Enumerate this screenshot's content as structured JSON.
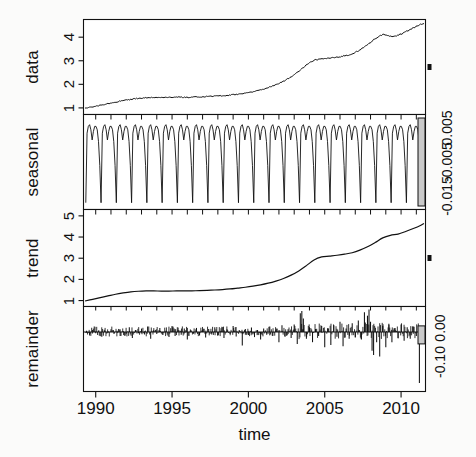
{
  "figure": {
    "type": "stl-decomposition",
    "xlabel": "time",
    "x_ticks": [
      "1990",
      "1995",
      "2000",
      "2005",
      "2010"
    ],
    "x_tick_values": [
      1990,
      1995,
      2000,
      2005,
      2010
    ],
    "xlim": [
      1989.2,
      2011.6
    ],
    "panels": [
      {
        "name": "data",
        "label": "data",
        "y_ticks": [
          "1",
          "2",
          "3",
          "4"
        ],
        "y_tick_values": [
          1,
          2,
          3,
          4
        ],
        "ylim": [
          0.72,
          4.75
        ],
        "scale_bar_label": ""
      },
      {
        "name": "seasonal",
        "label": "seasonal",
        "y_ticks": [],
        "y_tick_values": [],
        "ylim": [
          -0.019,
          0.009
        ],
        "scale_bar_labels": [
          "-0.015",
          "-0.005",
          "0.005"
        ],
        "scale_bar_values": [
          -0.015,
          -0.005,
          0.005
        ]
      },
      {
        "name": "trend",
        "label": "trend",
        "y_ticks": [
          "1",
          "2",
          "3",
          "4",
          "5"
        ],
        "y_tick_values": [
          1,
          2,
          3,
          4,
          5
        ],
        "ylim": [
          0.72,
          5.3
        ],
        "scale_bar_label": ""
      },
      {
        "name": "remainder",
        "label": "remainder",
        "y_ticks": [],
        "y_tick_values": [],
        "ylim": [
          -0.175,
          0.075
        ],
        "scale_bar_labels": [
          "-0.10",
          "0.00"
        ],
        "scale_bar_values": [
          -0.1,
          0.0
        ]
      }
    ]
  },
  "chart_data": {
    "type": "line",
    "title": "",
    "xlabel": "time",
    "ylabel": "",
    "grid": false,
    "legend": "none",
    "xlim": [
      1989.2,
      2011.6
    ],
    "x_ticks": [
      1990,
      1995,
      2000,
      2005,
      2010
    ],
    "series": [
      {
        "name": "data",
        "panel": "data",
        "ylim": [
          0.72,
          4.75
        ],
        "y_ticks": [
          1,
          2,
          3,
          4
        ],
        "x": [
          1989.3,
          1989.6,
          1989.9,
          1990.2,
          1990.5,
          1990.8,
          1991.1,
          1991.4,
          1991.7,
          1992.0,
          1992.3,
          1992.6,
          1992.9,
          1993.2,
          1993.5,
          1993.8,
          1994.1,
          1994.4,
          1994.7,
          1995.0,
          1995.3,
          1995.6,
          1995.9,
          1996.2,
          1996.5,
          1996.8,
          1997.1,
          1997.4,
          1997.7,
          1998.0,
          1998.3,
          1998.6,
          1998.9,
          1999.2,
          1999.5,
          1999.8,
          2000.1,
          2000.4,
          2000.7,
          2001.0,
          2001.3,
          2001.6,
          2001.9,
          2002.2,
          2002.5,
          2002.8,
          2003.1,
          2003.4,
          2003.7,
          2004.0,
          2004.3,
          2004.6,
          2004.9,
          2005.2,
          2005.5,
          2005.8,
          2006.1,
          2006.4,
          2006.7,
          2007.0,
          2007.3,
          2007.6,
          2007.9,
          2008.2,
          2008.5,
          2008.8,
          2009.1,
          2009.4,
          2009.7,
          2010.0,
          2010.3,
          2010.6,
          2010.9,
          2011.2,
          2011.5
        ],
        "y": [
          0.98,
          1.02,
          1.06,
          1.1,
          1.14,
          1.18,
          1.22,
          1.26,
          1.3,
          1.33,
          1.36,
          1.39,
          1.41,
          1.43,
          1.44,
          1.45,
          1.45,
          1.44,
          1.44,
          1.45,
          1.46,
          1.46,
          1.45,
          1.45,
          1.46,
          1.47,
          1.48,
          1.49,
          1.5,
          1.51,
          1.52,
          1.53,
          1.55,
          1.57,
          1.59,
          1.62,
          1.66,
          1.7,
          1.75,
          1.8,
          1.86,
          1.93,
          2.01,
          2.1,
          2.2,
          2.32,
          2.45,
          2.6,
          2.76,
          2.92,
          3.02,
          3.06,
          3.08,
          3.1,
          3.12,
          3.15,
          3.18,
          3.22,
          3.28,
          3.36,
          3.46,
          3.58,
          3.72,
          3.88,
          4.02,
          4.12,
          4.08,
          4.02,
          4.06,
          4.14,
          4.22,
          4.32,
          4.42,
          4.52,
          4.58
        ]
      },
      {
        "name": "seasonal",
        "panel": "seasonal",
        "ylim": [
          -0.019,
          0.009
        ],
        "cycles": 22,
        "period_years": 1,
        "description": "annual sawtooth: broad high plateau with a small M-shaped notch, then a sharp narrow trough",
        "amplitude_high": 0.006,
        "amplitude_low": -0.017,
        "cycle_shape_y": [
          -0.017,
          0.0035,
          0.0055,
          0.006,
          0.0045,
          0.0015,
          0.004,
          0.0055,
          0.0055,
          0.0045,
          0.001,
          -0.006,
          -0.017
        ]
      },
      {
        "name": "trend",
        "panel": "trend",
        "ylim": [
          0.72,
          5.3
        ],
        "y_ticks": [
          1,
          2,
          3,
          4,
          5
        ],
        "x": [
          1989.3,
          1989.8,
          1990.3,
          1990.8,
          1991.3,
          1991.8,
          1992.3,
          1992.8,
          1993.3,
          1993.8,
          1994.3,
          1994.8,
          1995.3,
          1995.8,
          1996.3,
          1996.8,
          1997.3,
          1997.8,
          1998.3,
          1998.8,
          1999.3,
          1999.8,
          2000.3,
          2000.8,
          2001.3,
          2001.8,
          2002.3,
          2002.8,
          2003.3,
          2003.8,
          2004.3,
          2004.8,
          2005.3,
          2005.8,
          2006.3,
          2006.8,
          2007.3,
          2007.8,
          2008.3,
          2008.8,
          2009.3,
          2009.8,
          2010.3,
          2010.8,
          2011.3,
          2011.5
        ],
        "y": [
          0.98,
          1.06,
          1.14,
          1.22,
          1.3,
          1.36,
          1.41,
          1.44,
          1.455,
          1.455,
          1.45,
          1.45,
          1.455,
          1.455,
          1.46,
          1.47,
          1.485,
          1.5,
          1.52,
          1.55,
          1.59,
          1.63,
          1.68,
          1.74,
          1.82,
          1.92,
          2.04,
          2.2,
          2.4,
          2.65,
          2.92,
          3.06,
          3.1,
          3.14,
          3.19,
          3.26,
          3.38,
          3.54,
          3.74,
          3.96,
          4.08,
          4.14,
          4.26,
          4.4,
          4.56,
          4.64
        ]
      },
      {
        "name": "remainder",
        "panel": "remainder",
        "type": "bar",
        "ylim": [
          -0.175,
          0.075
        ],
        "baseline": 0.0,
        "description": "high-frequency residual spikes around zero; largest positive spikes near 2003.5 and 2008, largest negative excursions near 2008-2009 and a deep spike at 2011",
        "x": [
          1989.4,
          1989.6,
          1989.8,
          1990.0,
          1990.2,
          1990.4,
          1990.6,
          1990.8,
          1991.0,
          1991.2,
          1991.4,
          1991.6,
          1991.8,
          1992.0,
          1992.2,
          1992.4,
          1992.6,
          1992.8,
          1993.0,
          1993.2,
          1993.4,
          1993.6,
          1993.8,
          1994.0,
          1994.2,
          1994.4,
          1994.6,
          1994.8,
          1995.0,
          1995.2,
          1995.4,
          1995.6,
          1995.8,
          1996.0,
          1996.2,
          1996.4,
          1996.6,
          1996.8,
          1997.0,
          1997.2,
          1997.4,
          1997.6,
          1997.8,
          1998.0,
          1998.2,
          1998.4,
          1998.6,
          1998.8,
          1999.0,
          1999.2,
          1999.4,
          1999.6,
          1999.8,
          2000.0,
          2000.2,
          2000.4,
          2000.6,
          2000.8,
          2001.0,
          2001.2,
          2001.4,
          2001.6,
          2001.8,
          2002.0,
          2002.2,
          2002.4,
          2002.6,
          2002.8,
          2003.0,
          2003.2,
          2003.4,
          2003.5,
          2003.6,
          2003.8,
          2004.0,
          2004.2,
          2004.4,
          2004.6,
          2004.8,
          2005.0,
          2005.2,
          2005.4,
          2005.6,
          2005.8,
          2006.0,
          2006.2,
          2006.4,
          2006.6,
          2006.8,
          2007.0,
          2007.2,
          2007.4,
          2007.6,
          2007.8,
          2007.9,
          2008.0,
          2008.1,
          2008.2,
          2008.4,
          2008.6,
          2008.8,
          2009.0,
          2009.2,
          2009.4,
          2009.6,
          2009.8,
          2010.0,
          2010.2,
          2010.4,
          2010.6,
          2010.8,
          2011.0,
          2011.2,
          2011.4
        ],
        "y": [
          0.004,
          -0.01,
          0.006,
          -0.004,
          0.005,
          -0.014,
          0.004,
          -0.003,
          0.008,
          -0.006,
          0.004,
          -0.012,
          0.003,
          -0.005,
          0.014,
          -0.018,
          0.006,
          -0.004,
          0.01,
          -0.007,
          0.016,
          -0.02,
          0.005,
          -0.006,
          0.012,
          -0.009,
          0.004,
          -0.015,
          0.018,
          -0.012,
          0.006,
          -0.008,
          0.01,
          -0.022,
          0.007,
          -0.005,
          0.012,
          -0.01,
          0.005,
          -0.016,
          0.009,
          -0.007,
          0.014,
          -0.011,
          0.004,
          -0.018,
          0.008,
          -0.006,
          0.018,
          -0.013,
          0.006,
          -0.04,
          0.009,
          -0.009,
          0.013,
          -0.015,
          0.006,
          -0.022,
          0.01,
          -0.008,
          0.016,
          -0.012,
          0.005,
          -0.03,
          0.02,
          -0.014,
          0.008,
          -0.018,
          0.022,
          -0.035,
          0.055,
          0.062,
          0.04,
          -0.02,
          0.014,
          -0.03,
          0.009,
          -0.012,
          0.018,
          -0.045,
          0.012,
          -0.038,
          0.02,
          -0.014,
          0.03,
          -0.042,
          0.01,
          -0.02,
          0.026,
          -0.016,
          0.034,
          -0.022,
          0.058,
          0.048,
          0.066,
          0.03,
          -0.055,
          -0.068,
          -0.03,
          -0.072,
          0.018,
          -0.045,
          0.024,
          -0.03,
          0.012,
          -0.018,
          0.022,
          -0.026,
          0.014,
          -0.02,
          0.016,
          -0.012,
          -0.15,
          0.01
        ]
      }
    ]
  }
}
